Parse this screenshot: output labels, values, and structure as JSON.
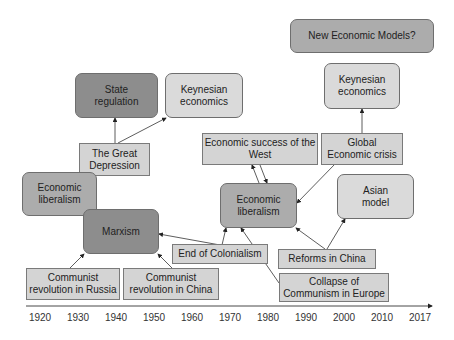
{
  "diagram": {
    "nodes": {
      "new_models": "New Economic Models?",
      "keynesian_right": "Keynesian\neconomics",
      "state_regulation": "State\nregulation",
      "keynesian_left": "Keynesian\neconomics",
      "great_depression": "The Great\nDepression",
      "econ_success_west": "Economic success of the\nWest",
      "global_crisis": "Global\nEconomic crisis",
      "econ_liberalism_left": "Economic\nliberalism",
      "econ_liberalism_center": "Economic\nliberalism",
      "asian_model": "Asian\nmodel",
      "marxism": "Marxism",
      "end_colonialism": "End of Colonialism",
      "reforms_china": "Reforms in China",
      "communist_russia": "Communist\nrevolution in Russia",
      "communist_china": "Communist\nrevolution in China",
      "collapse_communism": "Collapse of\nCommunism in Europe"
    },
    "colors": {
      "dark": "#8d8d8d",
      "medium": "#acacac",
      "light": "#dadada",
      "rect": "#d4d4d4"
    }
  },
  "timeline": {
    "years": [
      "1920",
      "1930",
      "1940",
      "1950",
      "1960",
      "1970",
      "1980",
      "1990",
      "2000",
      "2010",
      "2017"
    ]
  }
}
